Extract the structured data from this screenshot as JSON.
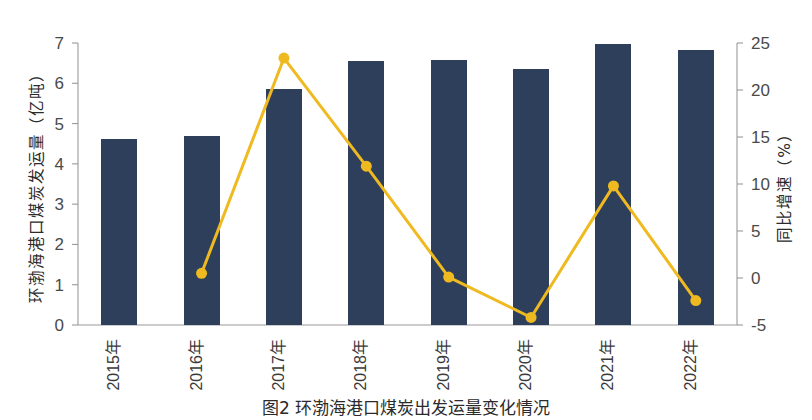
{
  "chart_data": {
    "type": "bar",
    "title": "",
    "caption": "图2   环渤海港口煤炭出发运量变化情况",
    "categories": [
      "2015年",
      "2016年",
      "2017年",
      "2018年",
      "2019年",
      "2020年",
      "2021年",
      "2022年"
    ],
    "xlabel": "",
    "ylabel": "环渤海港口煤炭发运量（亿吨）",
    "y2label": "同比增速（%）",
    "ylim": [
      0,
      7
    ],
    "y2lim": [
      -5,
      25
    ],
    "ytick_labels": [
      "0",
      "1",
      "2",
      "3",
      "4",
      "5",
      "6",
      "7"
    ],
    "ytick_values": [
      0,
      1,
      2,
      3,
      4,
      5,
      6,
      7
    ],
    "y2tick_labels": [
      "-5",
      "0",
      "5",
      "10",
      "15",
      "20",
      "25"
    ],
    "y2tick_values": [
      -5,
      0,
      5,
      10,
      15,
      20,
      25
    ],
    "grid": false,
    "legend": "none",
    "series": [
      {
        "name": "环渤海港口煤炭发运量",
        "kind": "bar",
        "axis": "left",
        "unit": "亿吨",
        "color": "#2e3f5c",
        "values": [
          4.62,
          4.7,
          5.85,
          6.56,
          6.57,
          6.35,
          6.97,
          6.82
        ]
      },
      {
        "name": "同比增速",
        "kind": "line",
        "axis": "right",
        "unit": "%",
        "color": "#efb920",
        "marker": "circle",
        "values": [
          null,
          0.5,
          23.4,
          11.9,
          0.1,
          -4.2,
          9.8,
          -2.4
        ]
      }
    ]
  }
}
